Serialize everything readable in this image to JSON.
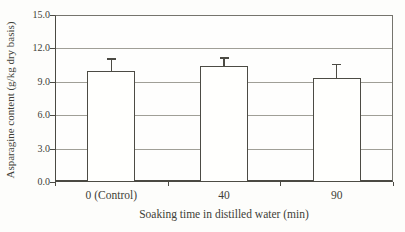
{
  "chart_data": {
    "type": "bar",
    "categories": [
      "0 (Control)",
      "40",
      "90"
    ],
    "values": [
      10.0,
      10.4,
      9.3
    ],
    "errors_plus": [
      1.1,
      0.8,
      1.3
    ],
    "xlabel": "Soaking time in distilled water (min)",
    "ylabel": "Asparagine content (g/kg dry basis)",
    "ylim": [
      0,
      15
    ],
    "ytick_step": 3,
    "ytick_labels": [
      "0.0",
      "3.0",
      "6.0",
      "9.0",
      "12.0",
      "15.0"
    ],
    "grid": "horizontal",
    "legend": "none",
    "bar_fill": "#fffffd",
    "bar_border": "#4c4b44",
    "gridline_color": "#a09f97",
    "axis_color": "#4a4942",
    "text_color": "#403e37"
  }
}
